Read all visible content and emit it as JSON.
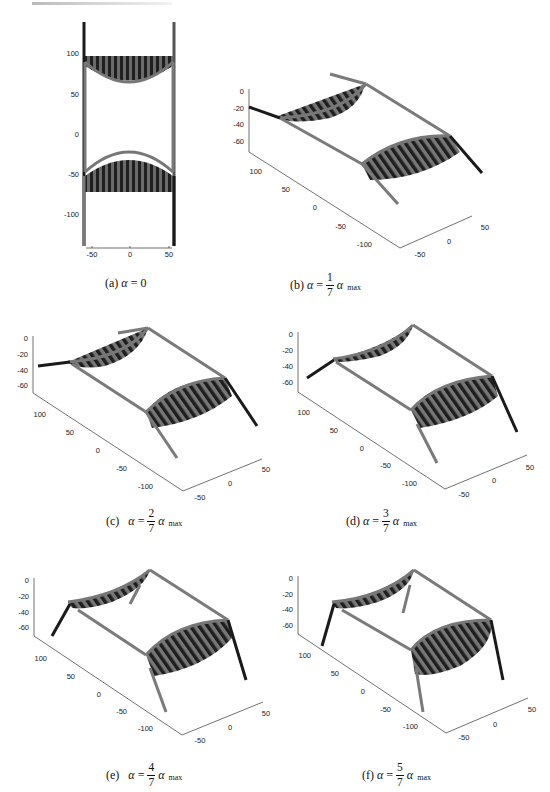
{
  "figure": {
    "panels": [
      {
        "id": "a",
        "caption": {
          "label": "(a)",
          "symbol": "α",
          "equals": "=",
          "value": "0"
        },
        "view": "top",
        "y_ticks": [
          "100",
          "50",
          "0",
          "-50",
          "-100"
        ],
        "x_ticks": [
          "-50",
          "0",
          "50"
        ]
      },
      {
        "id": "b",
        "caption": {
          "label": "(b)",
          "symbol": "α",
          "equals": "=",
          "num": "1",
          "den": "7",
          "symbol2": "α",
          "sub": "max"
        },
        "view": "3d",
        "z_ticks": [
          "0",
          "-20",
          "-40",
          "-60"
        ],
        "y_ticks": [
          "100",
          "50",
          "0",
          "-50",
          "-100"
        ],
        "x_ticks": [
          "-50",
          "0",
          "50"
        ]
      },
      {
        "id": "c",
        "caption": {
          "label": "(c)",
          "symbol": "α",
          "equals": "=",
          "num": "2",
          "den": "7",
          "symbol2": "α",
          "sub": "max"
        },
        "view": "3d",
        "z_ticks": [
          "0",
          "-20",
          "-40",
          "-60"
        ],
        "y_ticks": [
          "100",
          "50",
          "0",
          "-50",
          "-100"
        ],
        "x_ticks": [
          "-50",
          "0",
          "50"
        ]
      },
      {
        "id": "d",
        "caption": {
          "label": "(d)",
          "symbol": "α",
          "equals": "=",
          "num": "3",
          "den": "7",
          "symbol2": "α",
          "sub": "max"
        },
        "view": "3d",
        "z_ticks": [
          "0",
          "-20",
          "-40",
          "-60"
        ],
        "y_ticks": [
          "100",
          "50",
          "0",
          "-50",
          "-100"
        ],
        "x_ticks": [
          "-50",
          "0",
          "50"
        ]
      },
      {
        "id": "e",
        "caption": {
          "label": "(e)",
          "symbol": "α",
          "equals": "=",
          "num": "4",
          "den": "7",
          "symbol2": "α",
          "sub": "max"
        },
        "view": "3d",
        "z_ticks": [
          "0",
          "-20",
          "-40",
          "-60"
        ],
        "y_ticks": [
          "100",
          "50",
          "0",
          "-50",
          "-100"
        ],
        "x_ticks": [
          "-50",
          "0",
          "50"
        ]
      },
      {
        "id": "f",
        "caption": {
          "label": "(f)",
          "symbol": "α",
          "equals": "=",
          "num": "5",
          "den": "7",
          "symbol2": "α",
          "sub": "max"
        },
        "view": "3d",
        "z_ticks": [
          "0",
          "-20",
          "-40",
          "-60"
        ],
        "y_ticks": [
          "100",
          "50",
          "0",
          "-50",
          "-100"
        ],
        "x_ticks": [
          "-50",
          "0",
          "50"
        ]
      }
    ]
  },
  "colors": {
    "frame_gray": "#7a7a7a",
    "leg_dark": "#1a1a1a",
    "stripe_dark": "#222222",
    "stripe_mid": "#6a6a6a",
    "axis": "#333333"
  }
}
